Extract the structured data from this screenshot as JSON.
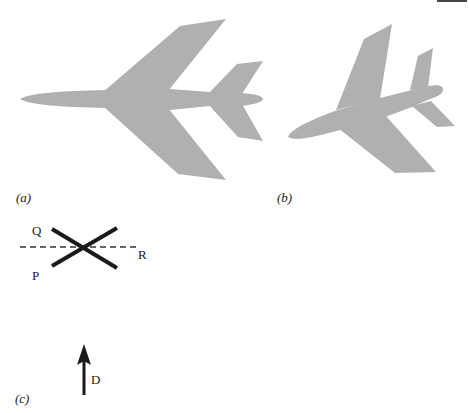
{
  "figure": {
    "panels": [
      {
        "id": "a",
        "label": "(a)",
        "content": "aircraft planform, swept wings, level attitude"
      },
      {
        "id": "b",
        "label": "(b)",
        "content": "aircraft planform, rotated/banked attitude"
      },
      {
        "id": "c",
        "label": "(c)",
        "content": "crossed lines P, Q with dashed reference R and direction arrow D"
      }
    ],
    "panel_c": {
      "line_labels": {
        "q": "Q",
        "p": "P",
        "r": "R"
      },
      "arrow_label": "D"
    },
    "colors": {
      "aircraft_fill": "#b0b0b0",
      "lines": "#1a1a1a",
      "background": "#ffffff"
    }
  },
  "labels": {
    "a": "(a)",
    "b": "(b)",
    "c": "(c)",
    "q": "Q",
    "p": "P",
    "r": "R",
    "d": "D"
  }
}
